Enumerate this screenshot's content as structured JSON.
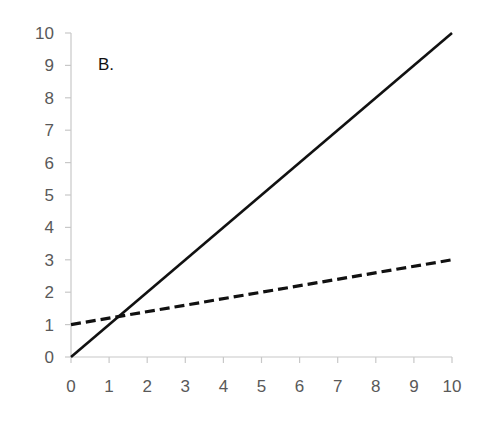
{
  "chart_data": {
    "type": "line",
    "title": "",
    "annotation": "B.",
    "xlabel": "",
    "ylabel": "",
    "xlim": [
      0,
      10
    ],
    "ylim": [
      0,
      10
    ],
    "grid": false,
    "legend": "none",
    "x_ticks": [
      "0",
      "1",
      "2",
      "3",
      "4",
      "5",
      "6",
      "7",
      "8",
      "9",
      "10"
    ],
    "y_ticks": [
      "0",
      "1",
      "2",
      "3",
      "4",
      "5",
      "6",
      "7",
      "8",
      "9",
      "10"
    ],
    "series": [
      {
        "name": "solid line",
        "style": "solid",
        "color": "#111111",
        "x": [
          0,
          10
        ],
        "y": [
          0,
          10
        ]
      },
      {
        "name": "dashed line",
        "style": "dashed",
        "color": "#111111",
        "x": [
          0,
          10
        ],
        "y": [
          1,
          3
        ]
      }
    ]
  }
}
